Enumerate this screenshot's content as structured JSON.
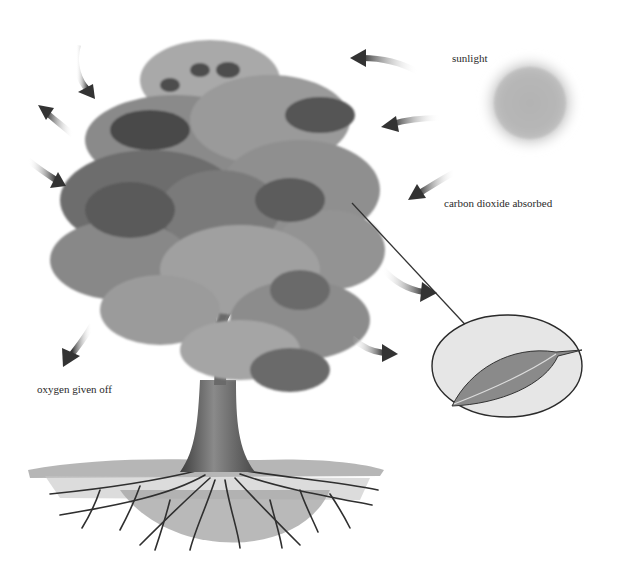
{
  "diagram": {
    "type": "illustration",
    "labels": {
      "sunlight": "sunlight",
      "carbon_dioxide": "carbon dioxide absorbed",
      "oxygen": "oxygen given off"
    },
    "elements": {
      "sun": "sun-icon",
      "tree": "tree",
      "leaf_inset": "leaf-magnified",
      "arrows_in": 4,
      "arrows_out": 5
    },
    "colors": {
      "background": "#ffffff",
      "foliage_dark": "#4a4a4a",
      "foliage_mid": "#7d7d7d",
      "foliage_light": "#a8a8a8",
      "sun": "#b8b8b8",
      "trunk": "#5a5a5a",
      "ground": "#9a9a9a",
      "inset_bg": "#e6e6e6",
      "text": "#2a2a2a"
    }
  }
}
